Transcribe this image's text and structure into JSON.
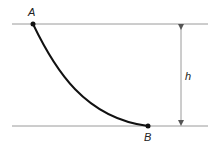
{
  "diagram": {
    "labels": {
      "point_a": "A",
      "point_b": "B",
      "height": "h"
    },
    "colors": {
      "reference_lines": "#9a9a9a",
      "curve": "#111111",
      "points": "#111111",
      "dimension_arrow": "#9a9a9a"
    }
  }
}
